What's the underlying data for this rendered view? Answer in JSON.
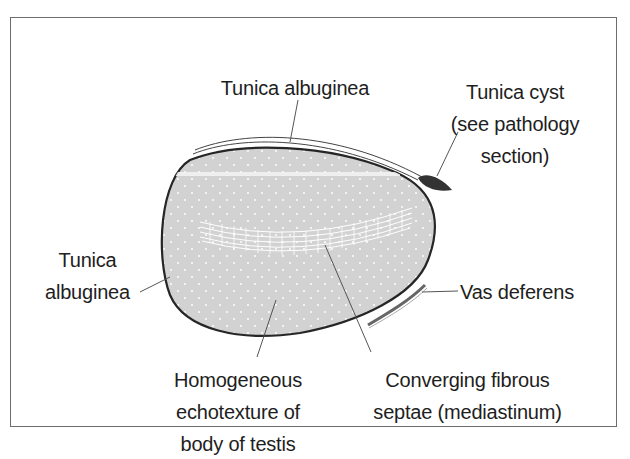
{
  "diagram": {
    "type": "anatomical-illustration",
    "colors": {
      "testis_fill": "#d2d2d2",
      "outline": "#262626",
      "cyst": "#3a3a3a",
      "leader_lines": "#555555",
      "frame": "#6d6d6d"
    },
    "labels": {
      "tunica_top": {
        "lines": [
          "Tunica albuginea"
        ]
      },
      "tunica_cyst": {
        "lines": [
          "Tunica cyst",
          "(see pathology",
          "section)"
        ]
      },
      "tunica_left": {
        "lines": [
          "Tunica",
          "albuginea"
        ]
      },
      "vas_deferens": {
        "lines": [
          "Vas deferens"
        ]
      },
      "homogeneous": {
        "lines": [
          "Homogeneous",
          "echotexture of",
          "body of testis"
        ]
      },
      "converging": {
        "lines": [
          "Converging fibrous",
          "septae (mediastinum)"
        ]
      }
    }
  }
}
